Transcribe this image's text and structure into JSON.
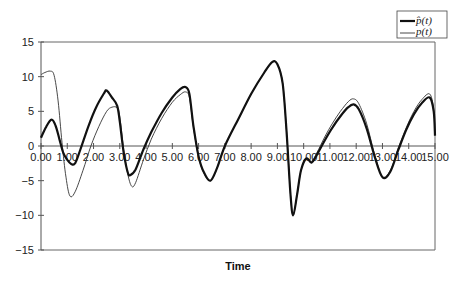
{
  "chart_data": {
    "type": "line",
    "title": "",
    "xlabel": "Time",
    "ylabel": "",
    "xlim": [
      0,
      15
    ],
    "ylim": [
      -15,
      15
    ],
    "grid": false,
    "legend_position": "top-right",
    "x_tick_labels": [
      "0.00",
      "1.00",
      "2.00",
      "3.00",
      "4.00",
      "5.00",
      "6.00",
      "7.00",
      "8.00",
      "9.00",
      "10.00",
      "11.00",
      "12.00",
      "13.00",
      "14.00",
      "15.00"
    ],
    "y_tick_labels": [
      "15",
      "10",
      "5",
      "0",
      "-5",
      "-10",
      "-15"
    ],
    "series": [
      {
        "name": "p̂(t)",
        "style": "thick",
        "color": "#111111",
        "x": [
          0,
          0.2,
          0.4,
          0.55,
          0.7,
          0.85,
          1.0,
          1.15,
          1.3,
          1.5,
          1.8,
          2.1,
          2.4,
          2.5,
          2.7,
          2.9,
          3.0,
          3.15,
          3.3,
          3.4,
          3.6,
          3.9,
          4.2,
          4.6,
          5.0,
          5.3,
          5.5,
          5.65,
          5.8,
          6.0,
          6.2,
          6.45,
          6.7,
          7.0,
          7.5,
          8.0,
          8.5,
          8.8,
          9.0,
          9.2,
          9.35,
          9.5,
          9.6,
          9.75,
          9.9,
          10.1,
          10.3,
          10.5,
          10.8,
          11.1,
          11.4,
          11.7,
          11.9,
          12.1,
          12.4,
          12.7,
          13.0,
          13.3,
          13.6,
          13.9,
          14.2,
          14.5,
          14.8,
          14.95,
          15.0
        ],
        "y": [
          1.2,
          2.8,
          3.8,
          3.0,
          1.0,
          -1.0,
          -2.0,
          -2.6,
          -2.5,
          -0.5,
          2.8,
          5.6,
          7.6,
          8.0,
          7.0,
          5.8,
          3.5,
          -1.0,
          -3.8,
          -4.2,
          -3.4,
          -0.5,
          2.0,
          4.8,
          7.0,
          8.2,
          8.5,
          7.5,
          3.0,
          -1.5,
          -3.8,
          -5.0,
          -3.2,
          0.0,
          3.8,
          7.5,
          10.6,
          12.1,
          11.8,
          9.0,
          2.0,
          -7.0,
          -10.0,
          -7.0,
          -3.5,
          -1.8,
          -2.4,
          -1.3,
          0.8,
          2.7,
          4.3,
          5.6,
          6.0,
          5.3,
          2.5,
          -1.5,
          -4.5,
          -3.7,
          -0.6,
          2.3,
          4.6,
          6.2,
          7.0,
          5.0,
          1.5
        ]
      },
      {
        "name": "p(t)",
        "style": "thin",
        "color": "#333333",
        "x": [
          0,
          0.15,
          0.35,
          0.5,
          0.65,
          0.8,
          0.95,
          1.1,
          1.3,
          1.6,
          1.9,
          2.2,
          2.5,
          2.7,
          2.9,
          3.0,
          3.15,
          3.3,
          3.45,
          3.6,
          3.9,
          4.2,
          4.6,
          5.0,
          5.3,
          5.5,
          5.65,
          5.8,
          6.0,
          6.2,
          6.45,
          6.7,
          7.0,
          7.5,
          8.0,
          8.5,
          8.8,
          9.0,
          9.2,
          9.35,
          9.5,
          9.6,
          9.75,
          9.9,
          10.1,
          10.3,
          10.5,
          10.8,
          11.1,
          11.4,
          11.7,
          11.9,
          12.1,
          12.4,
          12.7,
          13.0,
          13.3,
          13.6,
          13.9,
          14.2,
          14.5,
          14.8,
          14.95,
          15.0
        ],
        "y": [
          10.3,
          10.6,
          10.8,
          10.2,
          6.5,
          0.5,
          -4.5,
          -7.2,
          -6.6,
          -3.5,
          0.0,
          2.8,
          5.0,
          5.6,
          5.5,
          4.2,
          -0.5,
          -4.0,
          -5.8,
          -5.3,
          -2.0,
          1.0,
          4.0,
          6.3,
          7.4,
          7.8,
          7.0,
          2.8,
          -1.6,
          -3.9,
          -5.0,
          -3.2,
          0.0,
          3.8,
          7.5,
          10.6,
          12.1,
          11.8,
          9.0,
          2.0,
          -7.0,
          -10.0,
          -7.0,
          -3.5,
          -1.8,
          -2.2,
          -1.0,
          1.3,
          3.3,
          5.0,
          6.4,
          6.8,
          6.1,
          3.2,
          -1.2,
          -4.5,
          -3.5,
          -0.3,
          2.6,
          5.0,
          6.7,
          7.5,
          5.3,
          1.5
        ]
      }
    ]
  },
  "legend": {
    "entries": [
      {
        "label": "p̂(t)",
        "style": "thick"
      },
      {
        "label": "p(t)",
        "style": "thin"
      }
    ]
  }
}
